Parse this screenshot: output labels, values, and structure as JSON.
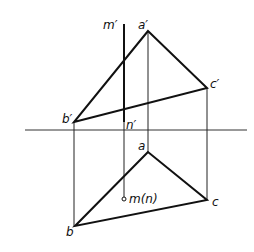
{
  "diagram": {
    "type": "orthographic-projection",
    "labels": {
      "m_prime": "m′",
      "a_prime": "a′",
      "b_prime": "b′",
      "c_prime": "c′",
      "n_prime": "n′",
      "a": "a",
      "b": "b",
      "c": "c",
      "mn": "m(n)"
    },
    "points": {
      "a_prime": [
        148,
        31
      ],
      "b_prime": [
        74,
        122
      ],
      "c_prime": [
        207,
        88
      ],
      "a": [
        148,
        152
      ],
      "b": [
        75,
        226
      ],
      "c": [
        207,
        200
      ],
      "mn": [
        124,
        199
      ]
    },
    "colors": {
      "line": "#111111",
      "axis": "#333333"
    }
  }
}
